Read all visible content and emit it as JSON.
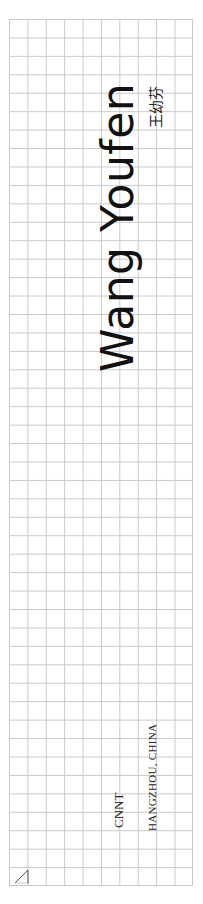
{
  "spine": {
    "title": "Wang Youfen",
    "chinese_name": "王幼芬",
    "publisher": "CNNT",
    "location": "HANGZHOU, CHINA"
  },
  "icons": {
    "corner": "arrow-up-right-icon"
  },
  "colors": {
    "grid": "#c9c9c9",
    "text": "#111111",
    "background": "#ffffff"
  }
}
